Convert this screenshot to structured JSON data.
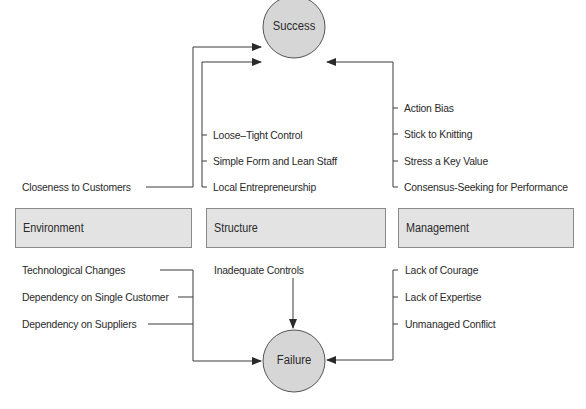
{
  "diagram": {
    "outcomes": {
      "success": "Success",
      "failure": "Failure"
    },
    "categories": [
      {
        "id": "environment",
        "label": "Environment"
      },
      {
        "id": "structure",
        "label": "Structure"
      },
      {
        "id": "management",
        "label": "Management"
      }
    ],
    "success_factors": {
      "environment": [
        "Closeness to Customers"
      ],
      "structure": [
        "Loose–Tight Control",
        "Simple Form and Lean Staff",
        "Local Entrepreneurship"
      ],
      "management": [
        "Action Bias",
        "Stick to Knitting",
        "Stress a Key Value",
        "Consensus-Seeking for Performance"
      ]
    },
    "failure_factors": {
      "environment": [
        "Technological Changes",
        "Dependency on Single Customer",
        "Dependency on Suppliers"
      ],
      "structure": [
        "Inadequate Controls"
      ],
      "management": [
        "Lack of Courage",
        "Lack of Expertise",
        "Unmanaged Conflict"
      ]
    },
    "colors": {
      "node_fill": "#d6d6d6",
      "box_fill": "#e3e3e3",
      "line": "#3a3a3a"
    }
  }
}
